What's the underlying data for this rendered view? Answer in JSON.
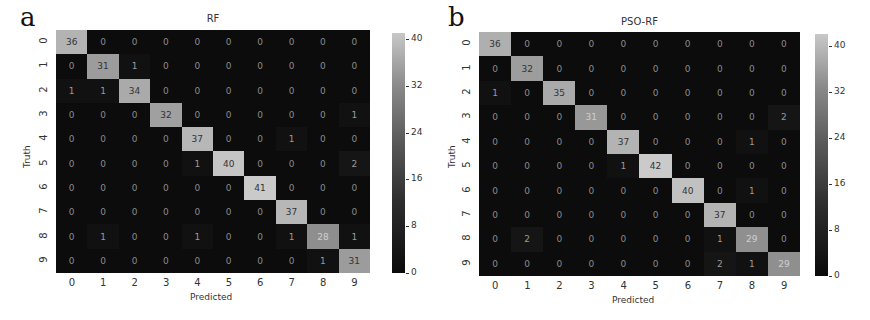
{
  "chart_data": [
    {
      "type": "heatmap",
      "panel": "a",
      "title": "RF",
      "xlabel": "Predicted",
      "ylabel": "Truth",
      "x_categories": [
        "0",
        "1",
        "2",
        "3",
        "4",
        "5",
        "6",
        "7",
        "8",
        "9"
      ],
      "y_categories": [
        "0",
        "1",
        "2",
        "3",
        "4",
        "5",
        "6",
        "7",
        "8",
        "9"
      ],
      "matrix": [
        [
          36,
          0,
          0,
          0,
          0,
          0,
          0,
          0,
          0,
          0
        ],
        [
          0,
          31,
          1,
          0,
          0,
          0,
          0,
          0,
          0,
          0
        ],
        [
          1,
          1,
          34,
          0,
          0,
          0,
          0,
          0,
          0,
          0
        ],
        [
          0,
          0,
          0,
          32,
          0,
          0,
          0,
          0,
          0,
          1
        ],
        [
          0,
          0,
          0,
          0,
          37,
          0,
          0,
          1,
          0,
          0
        ],
        [
          0,
          0,
          0,
          0,
          1,
          40,
          0,
          0,
          0,
          2
        ],
        [
          0,
          0,
          0,
          0,
          0,
          0,
          41,
          0,
          0,
          0
        ],
        [
          0,
          0,
          0,
          0,
          0,
          0,
          0,
          37,
          0,
          0
        ],
        [
          0,
          1,
          0,
          0,
          1,
          0,
          0,
          1,
          28,
          1
        ],
        [
          0,
          0,
          0,
          0,
          0,
          0,
          0,
          0,
          1,
          31
        ]
      ],
      "colorbar": {
        "ticks": [
          "0",
          "8",
          "16",
          "24",
          "32",
          "40"
        ],
        "range": [
          0,
          41
        ]
      }
    },
    {
      "type": "heatmap",
      "panel": "b",
      "title": "PSO-RF",
      "xlabel": "Predicted",
      "ylabel": "Truth",
      "x_categories": [
        "0",
        "1",
        "2",
        "3",
        "4",
        "5",
        "6",
        "7",
        "8",
        "9"
      ],
      "y_categories": [
        "0",
        "1",
        "2",
        "3",
        "4",
        "5",
        "6",
        "7",
        "8",
        "9"
      ],
      "matrix": [
        [
          36,
          0,
          0,
          0,
          0,
          0,
          0,
          0,
          0,
          0
        ],
        [
          0,
          32,
          0,
          0,
          0,
          0,
          0,
          0,
          0,
          0
        ],
        [
          1,
          0,
          35,
          0,
          0,
          0,
          0,
          0,
          0,
          0
        ],
        [
          0,
          0,
          0,
          31,
          0,
          0,
          0,
          0,
          0,
          2
        ],
        [
          0,
          0,
          0,
          0,
          37,
          0,
          0,
          0,
          1,
          0
        ],
        [
          0,
          0,
          0,
          0,
          1,
          42,
          0,
          0,
          0,
          0
        ],
        [
          0,
          0,
          0,
          0,
          0,
          0,
          40,
          0,
          1,
          0
        ],
        [
          0,
          0,
          0,
          0,
          0,
          0,
          0,
          37,
          0,
          0
        ],
        [
          0,
          2,
          0,
          0,
          0,
          0,
          0,
          1,
          29,
          0
        ],
        [
          0,
          0,
          0,
          0,
          0,
          0,
          0,
          2,
          1,
          29
        ]
      ],
      "colorbar": {
        "ticks": [
          "0",
          "8",
          "16",
          "24",
          "32",
          "40"
        ],
        "range": [
          0,
          42
        ]
      }
    }
  ]
}
